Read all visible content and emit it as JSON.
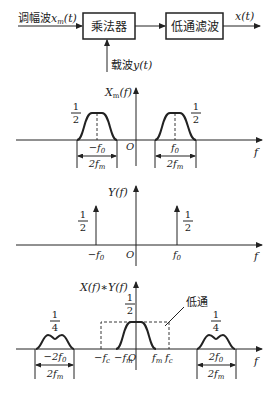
{
  "block_diagram": {
    "input_label": "调幅波",
    "input_signal": "x",
    "input_sub": "m",
    "input_arg": "(t)",
    "multiplier_label": "乘法器",
    "lowpass_label": "低通滤波",
    "output_label": "x(t)",
    "carrier_label": "载波",
    "carrier_signal": "y(t)"
  },
  "plot1": {
    "ylabel": "X",
    "ylabel_sub": "m",
    "ylabel_arg": "(f)",
    "xlabel": "f",
    "origin": "O",
    "left_center": "−f",
    "left_center_sub": "0",
    "right_center": "f",
    "right_center_sub": "0",
    "amp_num": "1",
    "amp_den": "2",
    "width_label": "2f",
    "width_sub": "m"
  },
  "plot2": {
    "ylabel": "Y(f)",
    "xlabel": "f",
    "origin": "O",
    "left_impulse": "−f",
    "left_impulse_sub": "0",
    "right_impulse": "f",
    "right_impulse_sub": "0",
    "amp_num": "1",
    "amp_den": "2"
  },
  "plot3": {
    "ylabel": "X(f)∗Y(f)",
    "xlabel": "f",
    "origin": "O",
    "center_amp_num": "1",
    "center_amp_den": "2",
    "side_amp_num": "1",
    "side_amp_den": "4",
    "left_side_center": "−2f",
    "left_side_center_sub": "0",
    "right_side_center": "2f",
    "right_side_center_sub": "0",
    "neg_fc": "−f",
    "neg_fc_sub": "c",
    "neg_fm": "−f",
    "neg_fm_sub": "m",
    "fm": "f",
    "fm_sub": "m",
    "fc": "f",
    "fc_sub": "c",
    "width_label": "2f",
    "width_sub": "m",
    "lowpass_annotation": "低通"
  }
}
